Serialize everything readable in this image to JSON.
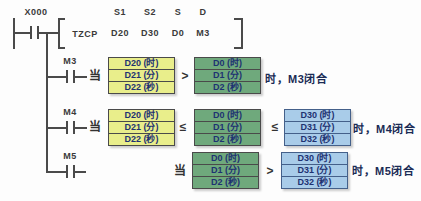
{
  "colors": {
    "s1_box_fill": "#e9ee8b",
    "s_box_fill": "#6fa97c",
    "s2_box_fill": "#a9cce9",
    "line": "#4a4a4a",
    "cell_text": "#1e3272",
    "annotation_text": "#1a2b55"
  },
  "instruction": {
    "contact_label": "X000",
    "name": "TZCP",
    "params": [
      {
        "label": "S1",
        "value": "D20"
      },
      {
        "label": "S2",
        "value": "D30"
      },
      {
        "label": "S",
        "value": "D0"
      },
      {
        "label": "D",
        "value": "M3"
      }
    ]
  },
  "rows": [
    {
      "contact_label": "M3",
      "when_label": "当",
      "s1_box": {
        "cells": [
          "D20 (时)",
          "D21 (分)",
          "D22 (秒)"
        ]
      },
      "op1": ">",
      "s_box": {
        "cells": [
          "D0 (时)",
          "D1 (分)",
          "D2 (秒)"
        ]
      },
      "result": "时，M3闭合"
    },
    {
      "contact_label": "M4",
      "when_label": "当",
      "s1_box": {
        "cells": [
          "D20 (时)",
          "D21 (分)",
          "D22 (秒)"
        ]
      },
      "op1": "≤",
      "s_box": {
        "cells": [
          "D0 (时)",
          "D1 (分)",
          "D2 (秒)"
        ]
      },
      "op2": "≤",
      "s2_box": {
        "cells": [
          "D30 (时)",
          "D31 (分)",
          "D32 (秒)"
        ]
      },
      "result": "时，M4闭合"
    },
    {
      "contact_label": "M5",
      "when_label": "当",
      "s_box": {
        "cells": [
          "D0 (时)",
          "D1 (分)",
          "D2 (秒)"
        ]
      },
      "op2": ">",
      "s2_box": {
        "cells": [
          "D30 (时)",
          "D31 (分)",
          "D32 (秒)"
        ]
      },
      "result": "时，M5闭合"
    }
  ]
}
